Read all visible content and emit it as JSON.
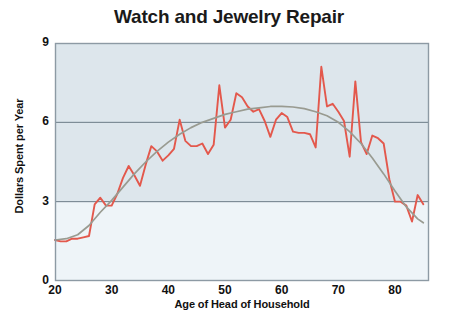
{
  "chart_data": {
    "type": "line",
    "title": "Watch and Jewelry Repair",
    "xlabel": "Age of Head of Household",
    "ylabel": "Dollars Spent per Year",
    "xlim": [
      20,
      86
    ],
    "ylim": [
      0,
      9
    ],
    "xticks": [
      20,
      30,
      40,
      50,
      60,
      70,
      80
    ],
    "yticks": [
      0,
      3,
      6,
      9
    ],
    "xtick_labels": [
      "20",
      "30",
      "40",
      "50",
      "60",
      "70",
      "80"
    ],
    "ytick_labels": [
      "0",
      "3",
      "6",
      "9"
    ],
    "grid": "horizontal",
    "legend": "none",
    "colors": {
      "data_line": "#e3584c",
      "trend_line": "#999b91",
      "plot_background": "#dde6ec",
      "lower_band_background": "#eef4f8",
      "gridline": "#6b7b86",
      "axis_border": "#8d9aa4",
      "title_text": "#1a1a1a"
    },
    "series": [
      {
        "name": "Dollars Spent per Year",
        "style": "jagged-raw-data",
        "color": "#e3584c",
        "x": [
          20,
          21,
          22,
          23,
          24,
          25,
          26,
          27,
          28,
          29,
          30,
          31,
          32,
          33,
          34,
          35,
          36,
          37,
          38,
          39,
          40,
          41,
          42,
          43,
          44,
          45,
          46,
          47,
          48,
          49,
          50,
          51,
          52,
          53,
          54,
          55,
          56,
          57,
          58,
          59,
          60,
          61,
          62,
          63,
          64,
          65,
          66,
          67,
          68,
          69,
          70,
          71,
          72,
          73,
          74,
          75,
          76,
          77,
          78,
          79,
          80,
          81,
          82,
          83,
          84,
          85
        ],
        "y": [
          1.55,
          1.5,
          1.5,
          1.6,
          1.6,
          1.65,
          1.7,
          2.9,
          3.15,
          2.85,
          2.85,
          3.3,
          3.9,
          4.35,
          4.0,
          3.6,
          4.4,
          5.1,
          4.9,
          4.55,
          4.75,
          5.0,
          6.1,
          5.3,
          5.1,
          5.1,
          5.2,
          4.8,
          5.15,
          7.4,
          5.8,
          6.1,
          7.1,
          6.95,
          6.6,
          6.4,
          6.5,
          6.05,
          5.45,
          6.1,
          6.35,
          6.2,
          5.65,
          5.6,
          5.6,
          5.55,
          5.05,
          8.1,
          6.6,
          6.7,
          6.4,
          6.05,
          4.7,
          7.55,
          5.25,
          4.8,
          5.5,
          5.4,
          5.2,
          3.85,
          3.0,
          3.0,
          2.85,
          2.25,
          3.25,
          2.9
        ]
      },
      {
        "name": "Smoothed trend",
        "style": "smooth-fit",
        "color": "#999b91",
        "x": [
          20,
          22,
          24,
          26,
          28,
          30,
          32,
          34,
          36,
          38,
          40,
          42,
          44,
          46,
          48,
          50,
          52,
          54,
          56,
          58,
          60,
          62,
          64,
          66,
          68,
          70,
          72,
          74,
          76,
          78,
          80,
          82,
          84,
          85
        ],
        "y": [
          1.55,
          1.6,
          1.75,
          2.1,
          2.6,
          3.05,
          3.55,
          4.05,
          4.5,
          4.9,
          5.25,
          5.55,
          5.8,
          6.0,
          6.15,
          6.3,
          6.4,
          6.5,
          6.55,
          6.6,
          6.6,
          6.58,
          6.52,
          6.4,
          6.25,
          6.0,
          5.65,
          5.2,
          4.65,
          4.05,
          3.4,
          2.8,
          2.35,
          2.2
        ]
      }
    ]
  },
  "plot_geometry": {
    "left": 55,
    "right": 429,
    "top": 43,
    "bottom": 281
  }
}
